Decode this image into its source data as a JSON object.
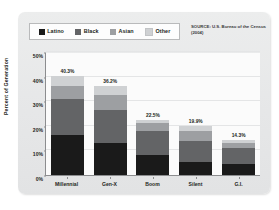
{
  "source_note": "SOURCE: U.S. Bureau of the Census (2004)",
  "legend": {
    "items": [
      {
        "label": "Latino",
        "color": "#1a1a1a"
      },
      {
        "label": "Black",
        "color": "#636466"
      },
      {
        "label": "Asian",
        "color": "#9d9fa2"
      },
      {
        "label": "Other",
        "color": "#cfd1d3"
      }
    ]
  },
  "axes": {
    "y_title": "Percent of Generation",
    "y_ticks": [
      "0%",
      "10%",
      "20%",
      "30%",
      "40%",
      "50%"
    ]
  },
  "chart_data": {
    "type": "bar",
    "title": "",
    "subtitle": "",
    "xlabel": "",
    "ylabel": "Percent of Generation",
    "ylim": [
      0,
      50
    ],
    "grid": true,
    "stacked": true,
    "legend_position": "top-left",
    "categories": [
      "Millennial",
      "Gen-X",
      "Boom",
      "Silent",
      "G.I."
    ],
    "series": [
      {
        "name": "Latino",
        "color": "#1a1a1a",
        "values": [
          16.4,
          13.1,
          8.3,
          5.2,
          4.4
        ]
      },
      {
        "name": "Black",
        "color": "#636466",
        "values": [
          14.3,
          13.4,
          9.6,
          8.8,
          6.5
        ]
      },
      {
        "name": "Asian",
        "color": "#9d9fa2",
        "values": [
          5.4,
          6.1,
          3.2,
          4.1,
          2.2
        ]
      },
      {
        "name": "Other",
        "color": "#cfd1d3",
        "values": [
          4.2,
          3.6,
          1.4,
          1.8,
          1.2
        ]
      }
    ],
    "totals": [
      40.3,
      36.2,
      22.5,
      19.9,
      14.3
    ],
    "total_labels": [
      "40.3%",
      "36.2%",
      "22.5%",
      "19.9%",
      "14.3%"
    ]
  }
}
